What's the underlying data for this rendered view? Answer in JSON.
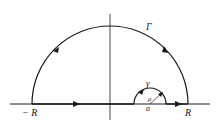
{
  "figure": {
    "labels": {
      "big_arc": "Γ",
      "small_arc": "γ",
      "left_endpoint": "− R",
      "right_endpoint": "R",
      "radius": "ρ",
      "center_point": "a"
    },
    "colors": {
      "stroke": "#1a1a1a",
      "background": "#ffffff"
    }
  }
}
